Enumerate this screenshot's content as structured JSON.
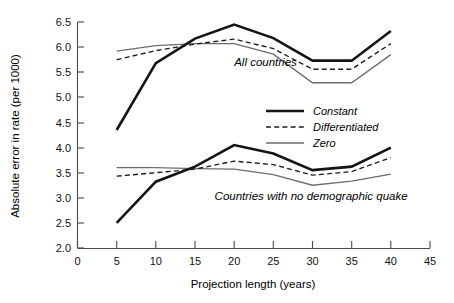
{
  "chart_data": {
    "type": "line",
    "title": "",
    "xlabel": "Projection length (years)",
    "ylabel": "Absolute error in rate (per 1000)",
    "xlim": [
      0,
      45
    ],
    "ylim": [
      2.0,
      6.5
    ],
    "xticks": [
      0,
      5,
      10,
      15,
      20,
      25,
      30,
      35,
      40,
      45
    ],
    "xtick_labels": [
      "0",
      "5",
      "10",
      "15",
      "20",
      "25",
      "30",
      "35",
      "40",
      "45"
    ],
    "yticks": [
      2.0,
      2.5,
      3.0,
      3.5,
      4.0,
      4.5,
      5.0,
      5.5,
      6.0,
      6.5
    ],
    "ytick_labels": [
      "2.0",
      "2.5",
      "3.0",
      "3.5",
      "4.0",
      "4.5",
      "5.0",
      "5.5",
      "6.0",
      "6.5"
    ],
    "grid": false,
    "legend_position": "center-right",
    "legend": [
      "Constant",
      "Differentiated",
      "Zero"
    ],
    "annotations": [
      {
        "text": "All countries",
        "x": 20.0,
        "y": 5.62
      },
      {
        "text": "Countries with no demographic quake",
        "x": 17.5,
        "y": 2.95
      }
    ],
    "groups": [
      {
        "name": "All countries",
        "x": [
          5,
          10,
          15,
          20,
          25,
          30,
          35,
          40
        ],
        "series": [
          {
            "name": "Constant",
            "values": [
              4.35,
              5.68,
              6.17,
              6.45,
              6.18,
              5.73,
              5.73,
              6.32
            ]
          },
          {
            "name": "Differentiated",
            "values": [
              5.75,
              5.93,
              6.06,
              6.16,
              5.97,
              5.56,
              5.56,
              6.07
            ]
          },
          {
            "name": "Zero",
            "values": [
              5.92,
              6.03,
              6.07,
              6.07,
              5.86,
              5.29,
              5.29,
              5.85
            ]
          }
        ]
      },
      {
        "name": "Countries with no demographic quake",
        "x": [
          5,
          10,
          15,
          20,
          25,
          30,
          35,
          40
        ],
        "series": [
          {
            "name": "Constant",
            "values": [
              2.5,
              3.32,
              3.62,
              4.05,
              3.88,
              3.55,
              3.62,
              4.0
            ]
          },
          {
            "name": "Differentiated",
            "values": [
              3.43,
              3.5,
              3.57,
              3.73,
              3.66,
              3.45,
              3.52,
              3.8
            ]
          },
          {
            "name": "Zero",
            "values": [
              3.6,
              3.6,
              3.58,
              3.57,
              3.46,
              3.25,
              3.33,
              3.47
            ]
          }
        ]
      }
    ]
  },
  "legend": {
    "items": [
      {
        "label": "Constant",
        "style": "solid-thick",
        "color": "#141414"
      },
      {
        "label": "Differentiated",
        "style": "dashed",
        "color": "#1d1d1d"
      },
      {
        "label": "Zero",
        "style": "solid-thin",
        "color": "#6d6d6d"
      }
    ]
  },
  "axes": {
    "x_title": "Projection length (years)",
    "y_title": "Absolute error in rate (per 1000)"
  },
  "annotations": {
    "all_countries": "All countries",
    "no_quake": "Countries with no demographic quake"
  }
}
